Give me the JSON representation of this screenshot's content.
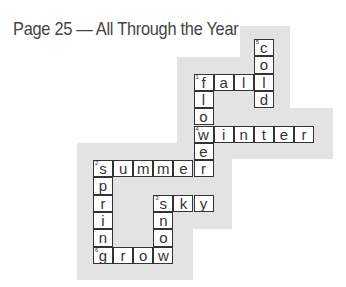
{
  "title": "Page 25 — All Through the Year",
  "colors": {
    "shading": "#e3e3e3",
    "grid_line": "#333333",
    "text": "#444444"
  },
  "grid": {
    "origin_x": 93,
    "origin_y": 39,
    "cell_w": 20.1,
    "cell_h": 17.3,
    "cells": [
      {
        "r": 0,
        "c": 8,
        "ch": "c",
        "num": "5"
      },
      {
        "r": 1,
        "c": 8,
        "ch": "o"
      },
      {
        "r": 2,
        "c": 5,
        "ch": "f",
        "num": "1"
      },
      {
        "r": 2,
        "c": 6,
        "ch": "a"
      },
      {
        "r": 2,
        "c": 7,
        "ch": "l"
      },
      {
        "r": 2,
        "c": 8,
        "ch": "l"
      },
      {
        "r": 3,
        "c": 5,
        "ch": "l"
      },
      {
        "r": 3,
        "c": 8,
        "ch": "d"
      },
      {
        "r": 4,
        "c": 5,
        "ch": "o"
      },
      {
        "r": 5,
        "c": 5,
        "ch": "w",
        "num": "4"
      },
      {
        "r": 5,
        "c": 6,
        "ch": "i"
      },
      {
        "r": 5,
        "c": 7,
        "ch": "n"
      },
      {
        "r": 5,
        "c": 8,
        "ch": "t"
      },
      {
        "r": 5,
        "c": 9,
        "ch": "e"
      },
      {
        "r": 5,
        "c": 10,
        "ch": "r"
      },
      {
        "r": 6,
        "c": 5,
        "ch": "e"
      },
      {
        "r": 7,
        "c": 0,
        "ch": "s",
        "num": "2"
      },
      {
        "r": 7,
        "c": 1,
        "ch": "u"
      },
      {
        "r": 7,
        "c": 2,
        "ch": "m"
      },
      {
        "r": 7,
        "c": 3,
        "ch": "m"
      },
      {
        "r": 7,
        "c": 4,
        "ch": "e"
      },
      {
        "r": 7,
        "c": 5,
        "ch": "r"
      },
      {
        "r": 8,
        "c": 0,
        "ch": "p"
      },
      {
        "r": 9,
        "c": 0,
        "ch": "r"
      },
      {
        "r": 9,
        "c": 3,
        "ch": "s",
        "num": "3"
      },
      {
        "r": 9,
        "c": 4,
        "ch": "k"
      },
      {
        "r": 9,
        "c": 5,
        "ch": "y"
      },
      {
        "r": 10,
        "c": 0,
        "ch": "i"
      },
      {
        "r": 10,
        "c": 3,
        "ch": "n"
      },
      {
        "r": 11,
        "c": 0,
        "ch": "n"
      },
      {
        "r": 11,
        "c": 3,
        "ch": "o"
      },
      {
        "r": 12,
        "c": 0,
        "ch": "g",
        "num": "6"
      },
      {
        "r": 12,
        "c": 1,
        "ch": "r"
      },
      {
        "r": 12,
        "c": 2,
        "ch": "o"
      },
      {
        "r": 12,
        "c": 3,
        "ch": "w"
      }
    ]
  },
  "answers": {
    "across": [
      {
        "num": "1",
        "word": "fall"
      },
      {
        "num": "2",
        "word": "summer"
      },
      {
        "num": "3",
        "word": "sky"
      },
      {
        "num": "4",
        "word": "winter"
      },
      {
        "num": "6",
        "word": "grow"
      }
    ],
    "down": [
      {
        "num": "1",
        "word": "flower"
      },
      {
        "num": "2",
        "word": "spring"
      },
      {
        "num": "3",
        "word": "snow"
      },
      {
        "num": "5",
        "word": "cold"
      }
    ]
  }
}
